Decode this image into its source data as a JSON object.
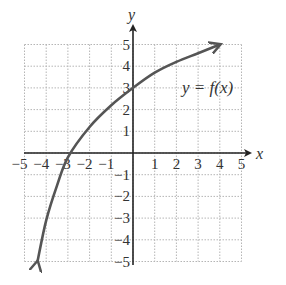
{
  "chart_data": {
    "type": "line",
    "title": "",
    "xlabel": "x",
    "ylabel": "y",
    "xlim": [
      -5,
      5
    ],
    "ylim": [
      -5,
      5
    ],
    "grid": true,
    "x_ticks": [
      -5,
      -4,
      -3,
      -2,
      -1,
      1,
      2,
      3,
      4,
      5
    ],
    "y_ticks": [
      -5,
      -4,
      -3,
      -2,
      -1,
      1,
      2,
      3,
      4,
      5
    ],
    "x_tick_labels": [
      "−5",
      "−4",
      "−3",
      "−2",
      "−1",
      "1",
      "2",
      "3",
      "4",
      "5"
    ],
    "y_tick_labels": [
      "−5",
      "−4",
      "−3",
      "−2",
      "−1",
      "1",
      "2",
      "3",
      "4",
      "5"
    ],
    "annotation": "y = f(x)",
    "series": [
      {
        "name": "y = f(x)",
        "x": [
          -4.4,
          -4.0,
          -3.5,
          -3.0,
          -2.0,
          -1.0,
          0.0,
          1.0,
          2.0,
          3.0,
          4.0
        ],
        "y": [
          -5.0,
          -3.1,
          -1.5,
          -0.2,
          1.2,
          2.2,
          3.0,
          3.7,
          4.2,
          4.6,
          5.0
        ],
        "arrows": "both ends"
      }
    ],
    "key_points": [
      {
        "x": -2.9,
        "y": 0,
        "label": "x-intercept"
      },
      {
        "x": 0,
        "y": 3,
        "label": "y-intercept"
      },
      {
        "x": 4,
        "y": 5,
        "label": "right arrow end"
      },
      {
        "x": -4.4,
        "y": -5,
        "label": "left arrow end"
      }
    ]
  },
  "labels": {
    "x_axis": "x",
    "y_axis": "y",
    "function": "y = f(x)"
  }
}
